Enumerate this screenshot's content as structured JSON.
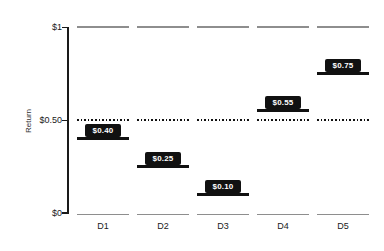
{
  "chart_data": {
    "type": "bar",
    "variant": "floating-step-markers",
    "categories": [
      "D1",
      "D2",
      "D3",
      "D4",
      "D5"
    ],
    "values": [
      0.4,
      0.25,
      0.1,
      0.55,
      0.75
    ],
    "value_labels": [
      "$0.40",
      "$0.25",
      "$0.10",
      "$0.55",
      "$0.75"
    ],
    "title": "",
    "xlabel": "",
    "ylabel": "Return",
    "ylim": [
      0,
      1
    ],
    "yticks": [
      {
        "value": 1,
        "label": "$1"
      },
      {
        "value": 0.5,
        "label": "$0.50"
      },
      {
        "value": 0,
        "label": "$0"
      }
    ],
    "reference_lines": [
      {
        "value": 1,
        "style": "solid",
        "color": "#8e8e8e",
        "segmented": true
      },
      {
        "value": 0.5,
        "style": "dotted",
        "color": "#111111",
        "segmented": true
      },
      {
        "value": 0,
        "style": "solid",
        "color": "#8e8e8e",
        "segmented": true
      }
    ],
    "grid": false,
    "legend": "none",
    "colors": {
      "bar": "#111111",
      "label_bg": "#111111",
      "label_text": "#ffffff",
      "segment_gray": "#8e8e8e",
      "axis": "#1a1a1a",
      "background": "#ffffff"
    }
  }
}
